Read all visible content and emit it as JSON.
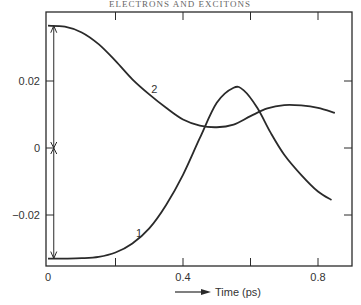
{
  "header": {
    "text": "ELECTRONS AND EXCITONS"
  },
  "chart_data": {
    "type": "line",
    "title": "",
    "xlabel": "Time (ps)",
    "ylabel": "",
    "xlim": [
      0,
      0.86
    ],
    "ylim": [
      -0.035,
      0.04
    ],
    "x_ticks": [
      0,
      0.2,
      0.4,
      0.6,
      0.8
    ],
    "x_tick_labels": [
      "0",
      "",
      "0.4",
      "",
      "0.8"
    ],
    "y_ticks": [
      -0.02,
      0,
      0.02
    ],
    "y_tick_labels": [
      "−0.02",
      "0",
      "0.02"
    ],
    "grid": false,
    "legend": "none",
    "series": [
      {
        "name": "1",
        "label": "1",
        "label_at": [
          0.27,
          -0.0265
        ],
        "x": [
          0.0,
          0.05,
          0.1,
          0.15,
          0.2,
          0.25,
          0.3,
          0.35,
          0.4,
          0.45,
          0.5,
          0.55,
          0.58,
          0.62,
          0.66,
          0.7,
          0.75,
          0.8,
          0.84
        ],
        "y": [
          -0.033,
          -0.033,
          -0.0329,
          -0.0325,
          -0.0312,
          -0.0285,
          -0.024,
          -0.017,
          -0.008,
          0.003,
          0.0135,
          0.018,
          0.0172,
          0.012,
          0.0045,
          -0.002,
          -0.008,
          -0.013,
          -0.0155
        ]
      },
      {
        "name": "2",
        "label": "2",
        "label_at": [
          0.315,
          0.0165
        ],
        "x": [
          0.0,
          0.05,
          0.1,
          0.15,
          0.2,
          0.25,
          0.3,
          0.35,
          0.4,
          0.45,
          0.5,
          0.55,
          0.6,
          0.65,
          0.7,
          0.75,
          0.8,
          0.85
        ],
        "y": [
          0.0365,
          0.0362,
          0.0345,
          0.031,
          0.026,
          0.0205,
          0.016,
          0.012,
          0.0085,
          0.0067,
          0.0062,
          0.007,
          0.0095,
          0.0118,
          0.0128,
          0.0127,
          0.012,
          0.0105
        ]
      }
    ],
    "annotations": [
      {
        "type": "double-arrow",
        "x": 0.02,
        "from": 0.0,
        "to": 0.0365
      },
      {
        "type": "double-arrow",
        "x": 0.02,
        "from": 0.0,
        "to": -0.033
      }
    ]
  }
}
